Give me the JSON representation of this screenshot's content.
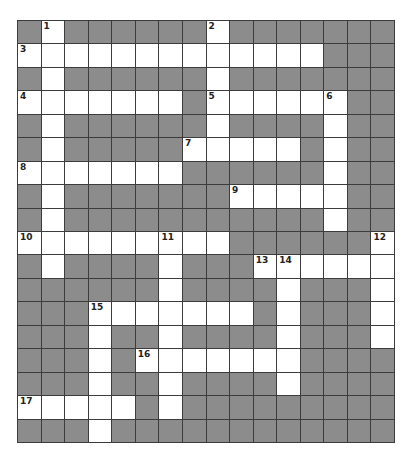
{
  "puzzle": {
    "rows": 18,
    "cols": 16,
    "colors": {
      "block": "#8c8c8c",
      "open": "#ffffff",
      "grid_line": "#3c3c3c"
    },
    "open_cells": [
      [
        0,
        1
      ],
      [
        0,
        8
      ],
      [
        1,
        0
      ],
      [
        1,
        1
      ],
      [
        1,
        2
      ],
      [
        1,
        3
      ],
      [
        1,
        4
      ],
      [
        1,
        5
      ],
      [
        1,
        6
      ],
      [
        1,
        7
      ],
      [
        1,
        8
      ],
      [
        1,
        9
      ],
      [
        1,
        10
      ],
      [
        1,
        11
      ],
      [
        1,
        12
      ],
      [
        2,
        1
      ],
      [
        2,
        8
      ],
      [
        3,
        0
      ],
      [
        3,
        1
      ],
      [
        3,
        2
      ],
      [
        3,
        3
      ],
      [
        3,
        4
      ],
      [
        3,
        5
      ],
      [
        3,
        6
      ],
      [
        3,
        8
      ],
      [
        3,
        9
      ],
      [
        3,
        10
      ],
      [
        3,
        11
      ],
      [
        3,
        12
      ],
      [
        3,
        13
      ],
      [
        4,
        1
      ],
      [
        4,
        8
      ],
      [
        4,
        13
      ],
      [
        5,
        1
      ],
      [
        5,
        7
      ],
      [
        5,
        8
      ],
      [
        5,
        9
      ],
      [
        5,
        10
      ],
      [
        5,
        11
      ],
      [
        5,
        13
      ],
      [
        6,
        0
      ],
      [
        6,
        1
      ],
      [
        6,
        2
      ],
      [
        6,
        3
      ],
      [
        6,
        4
      ],
      [
        6,
        5
      ],
      [
        6,
        6
      ],
      [
        6,
        13
      ],
      [
        7,
        1
      ],
      [
        7,
        9
      ],
      [
        7,
        10
      ],
      [
        7,
        11
      ],
      [
        7,
        12
      ],
      [
        7,
        13
      ],
      [
        8,
        1
      ],
      [
        8,
        13
      ],
      [
        9,
        0
      ],
      [
        9,
        1
      ],
      [
        9,
        2
      ],
      [
        9,
        3
      ],
      [
        9,
        4
      ],
      [
        9,
        5
      ],
      [
        9,
        6
      ],
      [
        9,
        7
      ],
      [
        9,
        8
      ],
      [
        9,
        15
      ],
      [
        10,
        1
      ],
      [
        10,
        6
      ],
      [
        10,
        10
      ],
      [
        10,
        11
      ],
      [
        10,
        12
      ],
      [
        10,
        13
      ],
      [
        10,
        14
      ],
      [
        10,
        15
      ],
      [
        11,
        6
      ],
      [
        11,
        11
      ],
      [
        11,
        15
      ],
      [
        12,
        3
      ],
      [
        12,
        4
      ],
      [
        12,
        5
      ],
      [
        12,
        6
      ],
      [
        12,
        7
      ],
      [
        12,
        8
      ],
      [
        12,
        9
      ],
      [
        12,
        11
      ],
      [
        12,
        15
      ],
      [
        13,
        3
      ],
      [
        13,
        6
      ],
      [
        13,
        11
      ],
      [
        13,
        15
      ],
      [
        14,
        3
      ],
      [
        14,
        5
      ],
      [
        14,
        6
      ],
      [
        14,
        7
      ],
      [
        14,
        8
      ],
      [
        14,
        9
      ],
      [
        14,
        10
      ],
      [
        14,
        11
      ],
      [
        15,
        3
      ],
      [
        15,
        6
      ],
      [
        15,
        11
      ],
      [
        16,
        0
      ],
      [
        16,
        1
      ],
      [
        16,
        2
      ],
      [
        16,
        3
      ],
      [
        16,
        4
      ],
      [
        16,
        6
      ],
      [
        17,
        3
      ]
    ],
    "clue_numbers": [
      {
        "row": 0,
        "col": 1,
        "label": "1"
      },
      {
        "row": 0,
        "col": 8,
        "label": "2"
      },
      {
        "row": 1,
        "col": 0,
        "label": "3"
      },
      {
        "row": 3,
        "col": 0,
        "label": "4"
      },
      {
        "row": 3,
        "col": 8,
        "label": "5"
      },
      {
        "row": 3,
        "col": 13,
        "label": "6"
      },
      {
        "row": 5,
        "col": 7,
        "label": "7"
      },
      {
        "row": 6,
        "col": 0,
        "label": "8"
      },
      {
        "row": 7,
        "col": 9,
        "label": "9"
      },
      {
        "row": 9,
        "col": 0,
        "label": "10"
      },
      {
        "row": 9,
        "col": 6,
        "label": "11"
      },
      {
        "row": 9,
        "col": 15,
        "label": "12"
      },
      {
        "row": 10,
        "col": 10,
        "label": "13"
      },
      {
        "row": 10,
        "col": 11,
        "label": "14"
      },
      {
        "row": 12,
        "col": 3,
        "label": "15"
      },
      {
        "row": 14,
        "col": 5,
        "label": "16"
      },
      {
        "row": 16,
        "col": 0,
        "label": "17"
      }
    ]
  }
}
